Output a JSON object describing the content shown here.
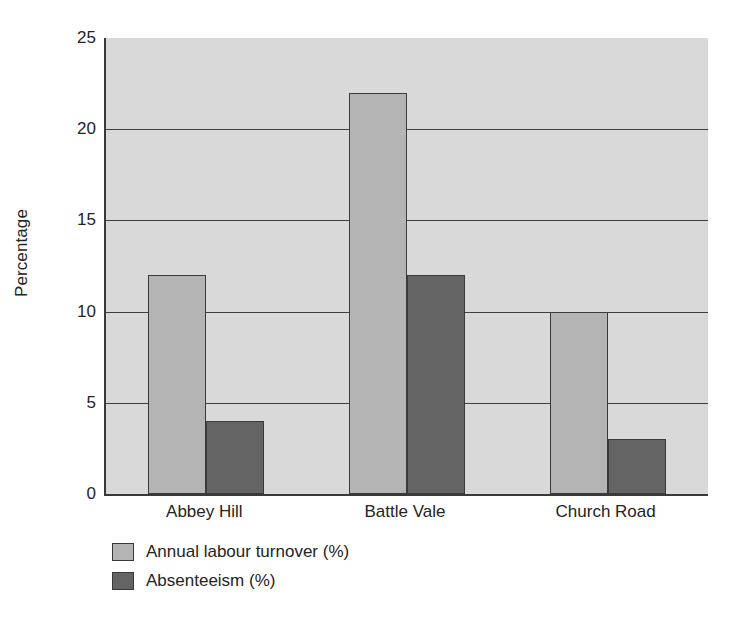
{
  "chart_data": {
    "type": "bar",
    "title": "",
    "subtitle": "",
    "xlabel": "",
    "ylabel": "Percentage",
    "categories": [
      "Abbey Hill",
      "Battle Vale",
      "Church Road"
    ],
    "series": [
      {
        "name": "Annual labour turnover (%)",
        "color": "#b4b4b4",
        "values": [
          12,
          22,
          10
        ]
      },
      {
        "name": "Absenteeism (%)",
        "color": "#646464",
        "values": [
          4,
          12,
          3
        ]
      }
    ],
    "ylim": [
      0,
      25
    ],
    "ytick_labels": [
      "0",
      "5",
      "10",
      "15",
      "20",
      "25"
    ],
    "ytick_values": [
      0,
      5,
      10,
      15,
      20,
      25
    ],
    "grid": true,
    "grid_axis": "y",
    "legend_position": "below-left",
    "plot_background": "#d9d9d9",
    "figure_background": "#ffffff",
    "axis_color": "#3a3a3a",
    "bar_edge_color": "#3a3a3a"
  }
}
